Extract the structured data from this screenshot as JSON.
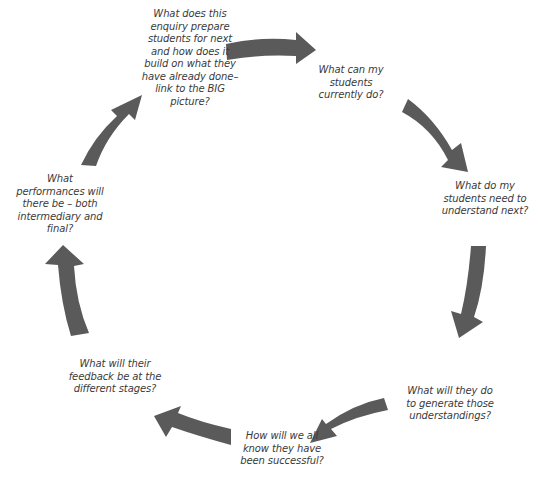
{
  "diagram": {
    "type": "cycle",
    "direction": "clockwise",
    "arrow_color": "#5a5a5a",
    "text_color": "#3a3a3a",
    "background_color": "#ffffff",
    "steps": [
      {
        "label": "What can my\nstudents\ncurrently do?"
      },
      {
        "label": "What do my\nstudents need to\nunderstand next?"
      },
      {
        "label": "What will they do\nto generate those\nunderstandings?"
      },
      {
        "label": "How will we all\nknow they have\nbeen successful?"
      },
      {
        "label": "What will their\nfeedback be at the\ndifferent stages?"
      },
      {
        "label": "What\nperformances will\nthere be – both\nintermediary and\nfinal?"
      },
      {
        "label": "What does this\nenquiry prepare\nstudents for next\nand how does it\nbuild on what they\nhave already done–\nlink to the BIG\npicture?"
      }
    ],
    "arrows": [
      {
        "from": 6,
        "to": 0,
        "direction": "right"
      },
      {
        "from": 0,
        "to": 1,
        "direction": "down-right"
      },
      {
        "from": 1,
        "to": 2,
        "direction": "down"
      },
      {
        "from": 2,
        "to": 3,
        "direction": "down-left"
      },
      {
        "from": 3,
        "to": 4,
        "direction": "left"
      },
      {
        "from": 4,
        "to": 5,
        "direction": "up"
      },
      {
        "from": 5,
        "to": 6,
        "direction": "up-right"
      }
    ]
  }
}
